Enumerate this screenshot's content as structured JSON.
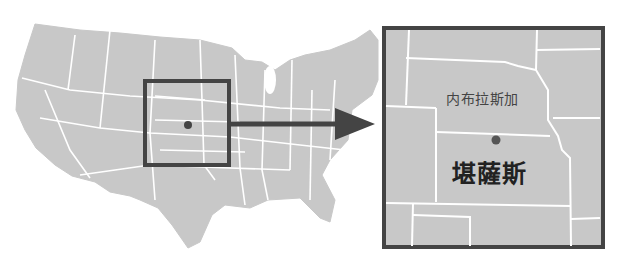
{
  "map": {
    "title": "",
    "overview": {
      "region": "contiguous-united-states",
      "fill": "#c8c8c8",
      "border": "#ffffff"
    },
    "inset_box": {
      "stroke": "#444444",
      "x": 145,
      "y": 81,
      "w": 84,
      "h": 84
    },
    "arrow": {
      "color": "#444444"
    },
    "detail_panel": {
      "stroke": "#444444",
      "fill": "#c8c8c8"
    },
    "marker_color": "#555555",
    "labels": {
      "nebraska": "内布拉斯加",
      "kansas": "堪薩斯"
    }
  }
}
